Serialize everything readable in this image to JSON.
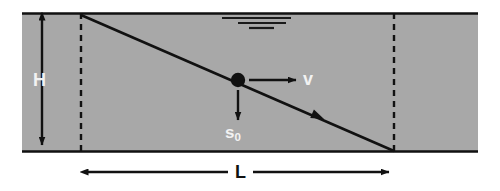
{
  "figure": {
    "type": "physics-diagram",
    "colors": {
      "background": "#ffffff",
      "region_fill": "#a8a8a8",
      "stroke": "#111111",
      "label_light": "#f2f2f2",
      "label_dark": "#111111"
    },
    "region": {
      "name": "shaded-rectangle",
      "x": 22,
      "y": 13,
      "width": 456,
      "height": 139
    },
    "dashed_lines": [
      {
        "name": "left-boundary",
        "x": 81,
        "y1": 13,
        "y2": 152
      },
      {
        "name": "right-boundary",
        "x": 394,
        "y1": 13,
        "y2": 152
      }
    ],
    "diagonal": {
      "name": "trajectory-line",
      "x1": 81,
      "y1": 15,
      "x2": 394,
      "y2": 151,
      "arrowhead_at": {
        "x": 320,
        "y": 118
      }
    },
    "point_mass": {
      "name": "point-mass",
      "cx": 238,
      "cy": 80,
      "r": 7
    },
    "vectors": [
      {
        "name": "velocity-vector",
        "label": "v",
        "from": {
          "x": 248,
          "y": 80
        },
        "to": {
          "x": 297,
          "y": 80
        },
        "direction": "right"
      },
      {
        "name": "initial-separation-vector",
        "label": "s",
        "sublabel": "0",
        "from": {
          "x": 238,
          "y": 89
        },
        "to": {
          "x": 238,
          "y": 121
        },
        "direction": "down"
      }
    ],
    "dimensions": [
      {
        "name": "height-dimension",
        "label": "H",
        "orientation": "vertical",
        "x": 42,
        "y1": 15,
        "y2": 150
      },
      {
        "name": "length-dimension",
        "label": "L",
        "orientation": "horizontal",
        "y": 172,
        "x1": 82,
        "x2": 395
      }
    ],
    "marks": {
      "name": "redacted-annotation",
      "description": "three short horizontal bars near the top of the region",
      "lines": [
        {
          "x1": 222,
          "x2": 291,
          "y": 18
        },
        {
          "x1": 238,
          "x2": 286,
          "y": 23
        },
        {
          "x1": 249,
          "x2": 274,
          "y": 28
        }
      ]
    },
    "labels": {
      "height": "H",
      "length": "L",
      "velocity": "v",
      "separation": "s",
      "separation_subscript": "0"
    }
  }
}
